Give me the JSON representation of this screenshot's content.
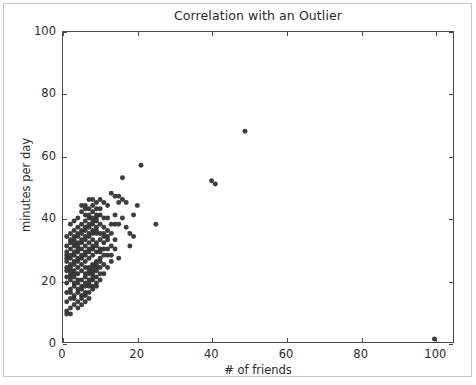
{
  "chart_data": {
    "type": "scatter",
    "title": "Correlation with an Outlier",
    "xlabel": "# of friends",
    "ylabel": "minutes per day",
    "xlim": [
      0,
      105
    ],
    "ylim": [
      0,
      100
    ],
    "xticks": [
      0,
      20,
      40,
      60,
      80,
      100
    ],
    "yticks": [
      0,
      20,
      40,
      60,
      80,
      100
    ],
    "xtick_labels": [
      "0",
      "20",
      "40",
      "60",
      "80",
      "100"
    ],
    "ytick_labels": [
      "0",
      "20",
      "40",
      "60",
      "80",
      "100"
    ],
    "grid": false,
    "legend": null,
    "marker": {
      "shape": "circle",
      "color": "#333333",
      "size_px": 5,
      "alpha": 0.95
    },
    "series": [
      {
        "name": "users",
        "points": [
          [
            49,
            68
          ],
          [
            41,
            51
          ],
          [
            40,
            52
          ],
          [
            100,
            1
          ],
          [
            25,
            38
          ],
          [
            21,
            57
          ],
          [
            20,
            44
          ],
          [
            19,
            41
          ],
          [
            18,
            35
          ],
          [
            18,
            31
          ],
          [
            16,
            53
          ],
          [
            15,
            47
          ],
          [
            15,
            45
          ],
          [
            14,
            47
          ],
          [
            14,
            38
          ],
          [
            13,
            28
          ],
          [
            15,
            27
          ],
          [
            13,
            48
          ],
          [
            12,
            40
          ],
          [
            12,
            36
          ],
          [
            11,
            37
          ],
          [
            11,
            34
          ],
          [
            10,
            46
          ],
          [
            10,
            43
          ],
          [
            10,
            33
          ],
          [
            10,
            30
          ],
          [
            10,
            26
          ],
          [
            10,
            22
          ],
          [
            9,
            45
          ],
          [
            9,
            41
          ],
          [
            9,
            39
          ],
          [
            9,
            35
          ],
          [
            9,
            32
          ],
          [
            9,
            29
          ],
          [
            9,
            25
          ],
          [
            9,
            21
          ],
          [
            9,
            18
          ],
          [
            8,
            44
          ],
          [
            8,
            42
          ],
          [
            8,
            38
          ],
          [
            8,
            36
          ],
          [
            8,
            33
          ],
          [
            8,
            31
          ],
          [
            8,
            28
          ],
          [
            8,
            25
          ],
          [
            8,
            23
          ],
          [
            8,
            20
          ],
          [
            8,
            17
          ],
          [
            7,
            43
          ],
          [
            7,
            40
          ],
          [
            7,
            37
          ],
          [
            7,
            35
          ],
          [
            7,
            32
          ],
          [
            7,
            30
          ],
          [
            7,
            27
          ],
          [
            7,
            24
          ],
          [
            7,
            22
          ],
          [
            7,
            19
          ],
          [
            7,
            16
          ],
          [
            6,
            41
          ],
          [
            6,
            39
          ],
          [
            6,
            36
          ],
          [
            6,
            34
          ],
          [
            6,
            31
          ],
          [
            6,
            29
          ],
          [
            6,
            26
          ],
          [
            6,
            24
          ],
          [
            6,
            21
          ],
          [
            6,
            18
          ],
          [
            6,
            15
          ],
          [
            5,
            42
          ],
          [
            5,
            38
          ],
          [
            5,
            36
          ],
          [
            5,
            33
          ],
          [
            5,
            30
          ],
          [
            5,
            28
          ],
          [
            5,
            25
          ],
          [
            5,
            23
          ],
          [
            5,
            20
          ],
          [
            5,
            17
          ],
          [
            5,
            14
          ],
          [
            4,
            40
          ],
          [
            4,
            37
          ],
          [
            4,
            34
          ],
          [
            4,
            32
          ],
          [
            4,
            29
          ],
          [
            4,
            27
          ],
          [
            4,
            24
          ],
          [
            4,
            22
          ],
          [
            4,
            19
          ],
          [
            4,
            16
          ],
          [
            4,
            13
          ],
          [
            3,
            39
          ],
          [
            3,
            36
          ],
          [
            3,
            33
          ],
          [
            3,
            31
          ],
          [
            3,
            28
          ],
          [
            3,
            26
          ],
          [
            3,
            23
          ],
          [
            3,
            21
          ],
          [
            3,
            18
          ],
          [
            3,
            15
          ],
          [
            3,
            12
          ],
          [
            2,
            38
          ],
          [
            2,
            35
          ],
          [
            2,
            32
          ],
          [
            2,
            30
          ],
          [
            2,
            27
          ],
          [
            2,
            25
          ],
          [
            2,
            22
          ],
          [
            2,
            20
          ],
          [
            2,
            17
          ],
          [
            2,
            14
          ],
          [
            2,
            11
          ],
          [
            1,
            34
          ],
          [
            1,
            31
          ],
          [
            1,
            29
          ],
          [
            1,
            26
          ],
          [
            1,
            24
          ],
          [
            1,
            21
          ],
          [
            1,
            19
          ],
          [
            1,
            16
          ],
          [
            1,
            13
          ],
          [
            1,
            10
          ],
          [
            1,
            9
          ],
          [
            2,
            9
          ],
          [
            1,
            28
          ],
          [
            2,
            23
          ],
          [
            3,
            25
          ],
          [
            4,
            26
          ],
          [
            5,
            27
          ],
          [
            6,
            28
          ],
          [
            7,
            29
          ],
          [
            8,
            30
          ],
          [
            9,
            31
          ],
          [
            10,
            35
          ],
          [
            11,
            32
          ],
          [
            12,
            30
          ],
          [
            11,
            28
          ],
          [
            10,
            27
          ],
          [
            9,
            24
          ],
          [
            8,
            21
          ],
          [
            7,
            18
          ],
          [
            6,
            16
          ],
          [
            5,
            15
          ],
          [
            4,
            17
          ],
          [
            3,
            19
          ],
          [
            2,
            21
          ],
          [
            5,
            44
          ],
          [
            6,
            44
          ],
          [
            7,
            46
          ],
          [
            8,
            46
          ],
          [
            4,
            35
          ],
          [
            3,
            34
          ],
          [
            9,
            37
          ],
          [
            10,
            38
          ],
          [
            11,
            40
          ],
          [
            12,
            34
          ],
          [
            13,
            35
          ],
          [
            14,
            33
          ],
          [
            9,
            43
          ],
          [
            8,
            40
          ],
          [
            7,
            41
          ],
          [
            6,
            43
          ],
          [
            11,
            45
          ],
          [
            12,
            44
          ],
          [
            10,
            20
          ],
          [
            11,
            22
          ],
          [
            12,
            24
          ],
          [
            13,
            26
          ],
          [
            9,
            19
          ],
          [
            8,
            18
          ],
          [
            7,
            14
          ],
          [
            6,
            13
          ],
          [
            5,
            12
          ],
          [
            4,
            11
          ],
          [
            3,
            14
          ],
          [
            2,
            16
          ],
          [
            6,
            22
          ],
          [
            7,
            23
          ],
          [
            8,
            24
          ],
          [
            9,
            26
          ],
          [
            10,
            24
          ],
          [
            11,
            25
          ],
          [
            5,
            18
          ],
          [
            4,
            20
          ],
          [
            3,
            22
          ],
          [
            2,
            24
          ],
          [
            1,
            23
          ],
          [
            6,
            19
          ],
          [
            7,
            20
          ],
          [
            8,
            22
          ],
          [
            9,
            23
          ],
          [
            10,
            29
          ],
          [
            11,
            30
          ],
          [
            12,
            28
          ],
          [
            13,
            31
          ],
          [
            14,
            30
          ],
          [
            15,
            38
          ],
          [
            16,
            40
          ],
          [
            17,
            37
          ],
          [
            19,
            34
          ],
          [
            4,
            30
          ],
          [
            5,
            32
          ],
          [
            6,
            33
          ],
          [
            7,
            34
          ],
          [
            8,
            35
          ],
          [
            9,
            36
          ],
          [
            3,
            29
          ],
          [
            2,
            28
          ],
          [
            1,
            27
          ],
          [
            2,
            33
          ],
          [
            3,
            32
          ],
          [
            4,
            31
          ],
          [
            5,
            35
          ],
          [
            6,
            37
          ],
          [
            7,
            38
          ],
          [
            8,
            39
          ],
          [
            9,
            40
          ],
          [
            10,
            41
          ],
          [
            11,
            35
          ],
          [
            12,
            33
          ],
          [
            13,
            38
          ],
          [
            14,
            41
          ],
          [
            16,
            46
          ],
          [
            17,
            45
          ]
        ]
      }
    ]
  }
}
